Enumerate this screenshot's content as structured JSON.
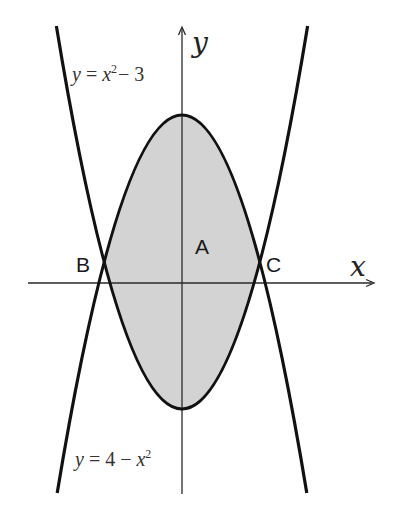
{
  "figure": {
    "origin_px": {
      "x": 182,
      "y": 283
    },
    "scale_px_per_unit": {
      "x": 41.6,
      "y": 42
    },
    "colors": {
      "curve": "#111111",
      "axis": "#2a2a2a",
      "region_fill": "#d3d3d3",
      "background": "#ffffff"
    },
    "axes": {
      "x_label": "x",
      "y_label": "y",
      "x_range": [
        -3.7,
        4.62
      ],
      "y_range": [
        -5.0,
        6.1
      ]
    },
    "curves": [
      {
        "name": "upward-parabola",
        "label": "y = x²− 3",
        "a": 1,
        "c": -3,
        "x_range": [
          -3.02,
          3.02
        ]
      },
      {
        "name": "downward-parabola",
        "label": "y = 4 − x²",
        "a": -1,
        "c": 4,
        "x_range": [
          -3.0,
          3.0
        ]
      }
    ],
    "region": {
      "label": "A",
      "x_range": [
        -1.8708,
        1.8708
      ],
      "upper": "y = 4 - x^2",
      "lower": "y = x^2 - 3"
    },
    "points": [
      {
        "label": "B",
        "x": -1.8708,
        "y": 0.5
      },
      {
        "label": "C",
        "x": 1.8708,
        "y": 0.5
      }
    ],
    "labels": {
      "top_equation": {
        "prefix": "y",
        "eq": " = ",
        "var": "x",
        "sup": "2",
        "rest": "− 3"
      },
      "bottom_equation": {
        "prefix": "y",
        "eq": " = 4 − ",
        "var": "x",
        "sup": "2"
      },
      "region_label": "A",
      "point_b": "B",
      "point_c": "C",
      "x_axis": "x",
      "y_axis": "y"
    }
  }
}
